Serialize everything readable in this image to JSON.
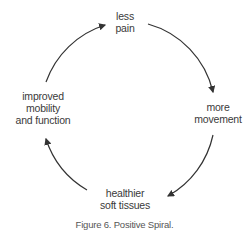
{
  "diagram": {
    "type": "cycle",
    "nodes": [
      {
        "id": "less-pain",
        "lines": [
          "less",
          "pain"
        ]
      },
      {
        "id": "more-movement",
        "lines": [
          "more",
          "movement"
        ]
      },
      {
        "id": "healthier-soft-tissues",
        "lines": [
          "healthier",
          "soft tissues"
        ]
      },
      {
        "id": "improved-mobility",
        "lines": [
          "improved",
          "mobility",
          "and function"
        ]
      }
    ],
    "edges": [
      {
        "from": "less-pain",
        "to": "more-movement"
      },
      {
        "from": "more-movement",
        "to": "healthier-soft-tissues"
      },
      {
        "from": "healthier-soft-tissues",
        "to": "improved-mobility"
      },
      {
        "from": "improved-mobility",
        "to": "less-pain"
      }
    ],
    "arrow_color": "#333333"
  },
  "caption": "Figure 6. Positive Spiral."
}
